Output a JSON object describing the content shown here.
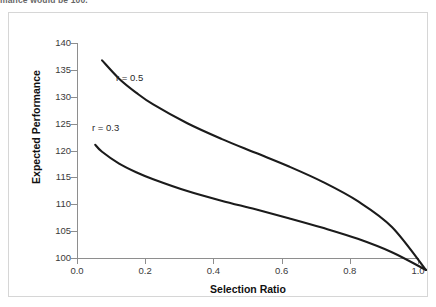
{
  "caption": {
    "text": "mance would be 100."
  },
  "figure": {
    "frame_color": "#d6d6d6",
    "background": "#ffffff"
  },
  "chart_data": {
    "type": "line",
    "title": "",
    "xlabel": "Selection Ratio",
    "ylabel": "Expected Performance",
    "xlim": [
      0.0,
      1.0
    ],
    "ylim": [
      100,
      140
    ],
    "xticks": [
      "0.0",
      "0.2",
      "0.4",
      "0.6",
      "0.8",
      "1.0"
    ],
    "xtick_values": [
      0.0,
      0.2,
      0.4,
      0.6,
      0.8,
      1.0
    ],
    "yticks": [
      "100",
      "105",
      "110",
      "115",
      "120",
      "125",
      "130",
      "135",
      "140"
    ],
    "ytick_values": [
      100,
      105,
      110,
      115,
      120,
      125,
      130,
      135,
      140
    ],
    "grid": false,
    "legend": "inline-annotations",
    "line_color": "#1b1b1b",
    "series": [
      {
        "name": "r = 0.5",
        "label": "r = 0.5",
        "annotation_position": "above-curve",
        "x": [
          0.05,
          0.1,
          0.15,
          0.2,
          0.3,
          0.4,
          0.5,
          0.6,
          0.7,
          0.8,
          0.9,
          1.0
        ],
        "values": [
          139.0,
          135.6,
          133.0,
          130.8,
          127.3,
          124.4,
          121.8,
          119.2,
          116.3,
          112.8,
          108.0,
          100.0
        ]
      },
      {
        "name": "r = 0.3",
        "label": "r = 0.3",
        "annotation_position": "above-curve",
        "x": [
          0.03,
          0.05,
          0.1,
          0.15,
          0.2,
          0.3,
          0.4,
          0.5,
          0.6,
          0.7,
          0.8,
          0.9,
          1.0
        ],
        "values": [
          123.3,
          122.0,
          119.8,
          118.2,
          116.9,
          114.7,
          112.9,
          111.3,
          109.6,
          107.8,
          105.8,
          103.3,
          100.0
        ]
      }
    ]
  }
}
